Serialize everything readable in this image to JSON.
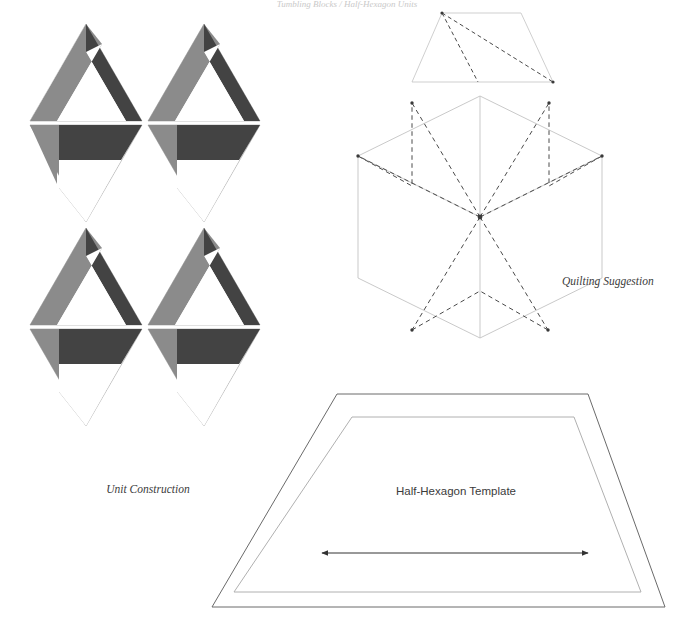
{
  "page": {
    "width": 694,
    "height": 639,
    "background": "#ffffff",
    "running_head": "Tumbling Blocks / Half-Hexagon Units"
  },
  "palette": {
    "dark": "#434343",
    "medium": "#8b8b8b",
    "light": "#ffffff",
    "hairline": "#9a9a9a",
    "template_outer": "#6a6a6a",
    "template_inner": "#b0b0b0",
    "dashed": "#4a4a4a",
    "hex_outline": "#c3c3c3",
    "text": "#3b3b3b"
  },
  "figures": [
    {
      "id": "unit-construction",
      "caption": "Unit Construction",
      "caption_x": 148,
      "caption_y": 493,
      "description": "Eight half-hexagon (equilateral triangle) pieced units arranged in two columns of alternating up- and down-pointing triangles, each built from a dark, a medium and a light parallelogram strip.",
      "columns": 2,
      "rows": 4,
      "unit_count": 8,
      "strip_colors": [
        "dark",
        "medium",
        "light"
      ]
    },
    {
      "id": "quilting-suggestion",
      "caption": "Quilting Suggestion",
      "caption_x": 562,
      "caption_y": 285,
      "description": "Hexagon divided into three rhombi with dashed quilting lines radiating from the centre to every vertex and forming three outer chevrons.",
      "shape": "hexagon",
      "rhombi": 3,
      "radiating_lines": 6,
      "has_half_hexagon_detail": true
    },
    {
      "id": "half-hexagon-template",
      "caption": "Half-Hexagon Template",
      "caption_x": 456,
      "caption_y": 495,
      "description": "Half-hexagon (trapezoid) template showing an outer cutting line, an inner seam line, and a double-headed straight-grain arrow.",
      "lines": [
        "cutting line",
        "seam line"
      ],
      "grain_arrow": true
    }
  ],
  "geometry": {
    "unit_construction": {
      "origin_x": 28,
      "origin_y": 30,
      "tri_width": 112,
      "tri_height": 98,
      "gap_x": 8,
      "gap_y": 4,
      "strip_fraction_a": 0.34,
      "strip_fraction_b": 0.67
    },
    "hexagon": {
      "center_x": 480,
      "center_y": 217,
      "radius": 122
    },
    "half_hex_detail": {
      "top_left_x": 442,
      "top_y": 13,
      "bottom_left_x": 412,
      "bottom_y": 82,
      "bottom_right_x": 553,
      "top_right_x": 521
    },
    "template": {
      "outer": "337,394 588,394 665,607 212,607",
      "inner": "352,417 574,417 641,592 234,592",
      "arrow_y": 553,
      "arrow_x1": 322,
      "arrow_x2": 588
    }
  }
}
